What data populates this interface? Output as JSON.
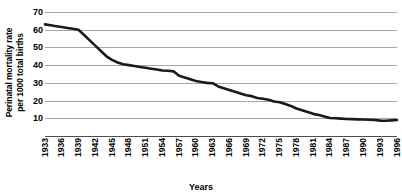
{
  "chart_data": {
    "type": "line",
    "title": "",
    "xlabel": "Years",
    "ylabel": "Perinatal mortality rate\nper 1000 total births",
    "ylim": [
      0,
      70
    ],
    "yticks": [
      10,
      20,
      30,
      40,
      50,
      60,
      70
    ],
    "grid": true,
    "legend": "none",
    "xlim": [
      1933,
      1996
    ],
    "tick_labels": [
      "1933",
      "1936",
      "1939",
      "1942",
      "1945",
      "1948",
      "1951",
      "1954",
      "1957",
      "1960",
      "1963",
      "1966",
      "1969",
      "1972",
      "1975",
      "1978",
      "1981",
      "1984",
      "1987",
      "1990",
      "1993",
      "1996"
    ],
    "line_color": "#1a1a1a",
    "grid_color": "#a6a6a6",
    "x": [
      1933,
      1934,
      1935,
      1936,
      1937,
      1938,
      1939,
      1940,
      1941,
      1942,
      1943,
      1944,
      1945,
      1946,
      1947,
      1948,
      1949,
      1950,
      1951,
      1952,
      1953,
      1954,
      1955,
      1956,
      1957,
      1958,
      1959,
      1960,
      1961,
      1962,
      1963,
      1964,
      1965,
      1966,
      1967,
      1968,
      1969,
      1970,
      1971,
      1972,
      1973,
      1974,
      1975,
      1976,
      1977,
      1978,
      1979,
      1980,
      1981,
      1982,
      1983,
      1984,
      1985,
      1986,
      1987,
      1988,
      1989,
      1990,
      1991,
      1992,
      1993,
      1994,
      1995,
      1996
    ],
    "values": [
      63,
      62.5,
      62,
      61.5,
      61,
      60.5,
      60,
      57,
      54,
      51,
      48,
      45,
      43,
      41.5,
      40.5,
      40,
      39.5,
      39,
      38.5,
      38,
      37.5,
      37,
      36.8,
      36.5,
      34,
      33,
      32,
      31,
      30.5,
      30,
      29.8,
      28,
      27,
      26,
      25,
      24,
      23,
      22.5,
      21.5,
      21,
      20.5,
      19.5,
      19,
      18,
      17,
      15.5,
      14.5,
      13.5,
      12.5,
      11.8,
      11,
      10.2,
      10,
      9.8,
      9.6,
      9.5,
      9.4,
      9.3,
      9.2,
      9,
      8.7,
      8.6,
      8.8,
      9
    ]
  }
}
